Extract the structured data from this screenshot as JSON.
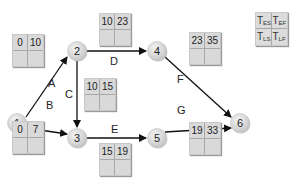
{
  "diagram": {
    "type": "activity-on-arrow network",
    "nodes": [
      {
        "id": "1",
        "label": "1",
        "x": 17,
        "y": 123
      },
      {
        "id": "2",
        "label": "2",
        "x": 77,
        "y": 51
      },
      {
        "id": "3",
        "label": "3",
        "x": 77,
        "y": 138
      },
      {
        "id": "4",
        "label": "4",
        "x": 157,
        "y": 51
      },
      {
        "id": "5",
        "label": "5",
        "x": 157,
        "y": 138
      },
      {
        "id": "6",
        "label": "6",
        "x": 240,
        "y": 123
      }
    ],
    "activities": [
      {
        "label": "A",
        "from": "1",
        "to": "2",
        "es": "0",
        "ef": "10",
        "ls": "",
        "lf": ""
      },
      {
        "label": "B",
        "from": "1",
        "to": "3",
        "es": "0",
        "ef": "7",
        "ls": "",
        "lf": ""
      },
      {
        "label": "C",
        "from": "2",
        "to": "3",
        "es": "10",
        "ef": "15",
        "ls": "",
        "lf": ""
      },
      {
        "label": "D",
        "from": "2",
        "to": "4",
        "es": "10",
        "ef": "23",
        "ls": "",
        "lf": ""
      },
      {
        "label": "E",
        "from": "3",
        "to": "5",
        "es": "15",
        "ef": "19",
        "ls": "",
        "lf": ""
      },
      {
        "label": "F",
        "from": "4",
        "to": "6",
        "es": "23",
        "ef": "35",
        "ls": "",
        "lf": ""
      },
      {
        "label": "G",
        "from": "5",
        "to": "6",
        "es": "19",
        "ef": "33",
        "ls": "",
        "lf": ""
      }
    ],
    "legend": {
      "es": {
        "main": "T",
        "sub": "ES"
      },
      "ef": {
        "main": "T",
        "sub": "EF"
      },
      "ls": {
        "main": "T",
        "sub": "LS"
      },
      "lf": {
        "main": "T",
        "sub": "LF"
      }
    },
    "colors": {
      "node_fill": "#dedede",
      "box_fill": "#d9d9d9",
      "arrow": "#111111"
    }
  }
}
